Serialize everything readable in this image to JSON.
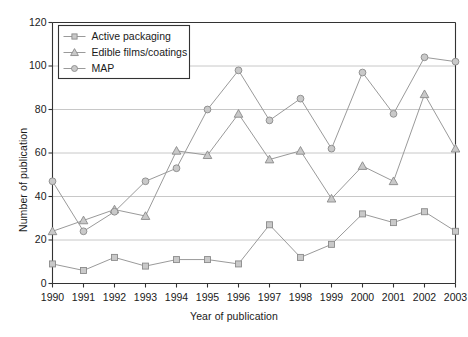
{
  "chart_data": {
    "type": "line",
    "title": "",
    "xlabel": "Year of publication",
    "ylabel": "Number of publication",
    "categories": [
      "1990",
      "1991",
      "1992",
      "1993",
      "1994",
      "1995",
      "1996",
      "1997",
      "1998",
      "1999",
      "2000",
      "2001",
      "2002",
      "2003"
    ],
    "x": [
      1990,
      1991,
      1992,
      1993,
      1994,
      1995,
      1996,
      1997,
      1998,
      1999,
      2000,
      2001,
      2002,
      2003
    ],
    "xlim": [
      1990,
      2003
    ],
    "ylim": [
      0,
      120
    ],
    "yticks": [
      0,
      20,
      40,
      60,
      80,
      100,
      120
    ],
    "xticks": [
      "1990",
      "1991",
      "1992",
      "1993",
      "1994",
      "1995",
      "1996",
      "1997",
      "1998",
      "1999",
      "2000",
      "2001",
      "2002",
      "2003"
    ],
    "grid": true,
    "grid_axis": "y",
    "legend_position": "upper left",
    "series": [
      {
        "name": "Active packaging",
        "marker": "square",
        "color": "#9a9a9a",
        "values": [
          9,
          6,
          12,
          8,
          11,
          11,
          9,
          27,
          12,
          18,
          32,
          28,
          33,
          24
        ]
      },
      {
        "name": "Edible films/coatings",
        "marker": "triangle",
        "color": "#9a9a9a",
        "values": [
          24,
          29,
          34,
          31,
          61,
          59,
          78,
          57,
          61,
          39,
          54,
          47,
          87,
          62
        ]
      },
      {
        "name": "MAP",
        "marker": "circle",
        "color": "#9a9a9a",
        "values": [
          47,
          24,
          33,
          47,
          53,
          80,
          98,
          75,
          85,
          62,
          97,
          78,
          104,
          102
        ]
      }
    ],
    "legend": [
      "Active packaging",
      "Edible films/coatings",
      "MAP"
    ],
    "colors": {
      "line": "#9a9a9a",
      "marker_fill": "#c9c9c9",
      "marker_stroke": "#8a8a8a",
      "grid": "#c8c8c8",
      "axis": "#333333",
      "text": "#1a1a1a"
    }
  }
}
